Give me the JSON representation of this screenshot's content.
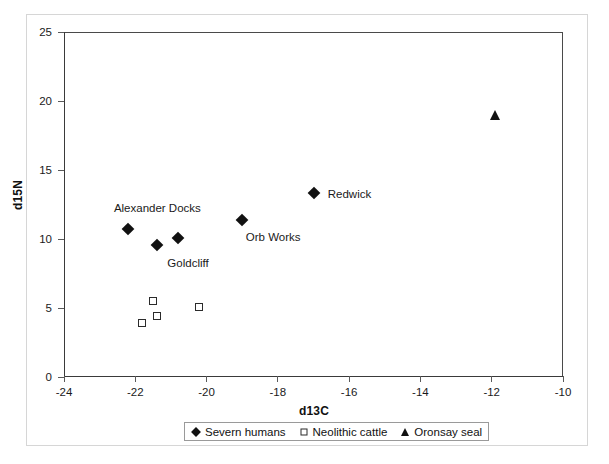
{
  "chart_data": {
    "type": "scatter",
    "title": "",
    "xlabel": "d13C",
    "ylabel": "d15N",
    "xlim": [
      -24,
      -10
    ],
    "ylim": [
      0,
      25
    ],
    "xticks": [
      -24,
      -22,
      -20,
      -18,
      -16,
      -14,
      -12,
      -10
    ],
    "yticks": [
      0,
      5,
      10,
      15,
      20,
      25
    ],
    "grid": false,
    "legend_position": "bottom-outside",
    "series": [
      {
        "name": "Severn humans",
        "marker": "filled-diamond",
        "color": "#111111",
        "points": [
          {
            "x": -22.2,
            "y": 10.7
          },
          {
            "x": -21.4,
            "y": 9.6
          },
          {
            "x": -20.8,
            "y": 10.1
          },
          {
            "x": -19.0,
            "y": 11.4
          },
          {
            "x": -17.0,
            "y": 13.3
          }
        ]
      },
      {
        "name": "Neolithic cattle",
        "marker": "open-square",
        "color": "#2b2b2b",
        "points": [
          {
            "x": -21.8,
            "y": 3.9
          },
          {
            "x": -21.5,
            "y": 5.5
          },
          {
            "x": -21.4,
            "y": 4.4
          },
          {
            "x": -20.2,
            "y": 5.1
          }
        ]
      },
      {
        "name": "Oronsay seal",
        "marker": "open-triangle",
        "color": "#111111",
        "points": [
          {
            "x": -11.9,
            "y": 19.0
          }
        ]
      }
    ],
    "annotations": [
      {
        "text": "Alexander Docks",
        "x": -22.6,
        "y": 12.2
      },
      {
        "text": "Goldcliff",
        "x": -21.1,
        "y": 8.2
      },
      {
        "text": "Orb Works",
        "x": -18.9,
        "y": 10.1
      },
      {
        "text": "Redwick",
        "x": -16.6,
        "y": 13.2
      }
    ]
  },
  "axes": {
    "y_labels": [
      "25",
      "20",
      "15",
      "10",
      "5",
      "0"
    ],
    "x_labels": [
      "-24",
      "-22",
      "-20",
      "-18",
      "-16",
      "-14",
      "-12",
      "-10"
    ],
    "y_title": "d15N",
    "x_title": "d13C"
  },
  "legend": {
    "entries": [
      {
        "label": "Severn humans",
        "icon": "filled-diamond-icon"
      },
      {
        "label": "Neolithic cattle",
        "icon": "open-square-icon"
      },
      {
        "label": "Oronsay seal",
        "icon": "open-triangle-icon"
      }
    ]
  },
  "annotations": {
    "alexander_docks": "Alexander Docks",
    "goldcliff": "Goldcliff",
    "orb_works": "Orb Works",
    "redwick": "Redwick"
  }
}
